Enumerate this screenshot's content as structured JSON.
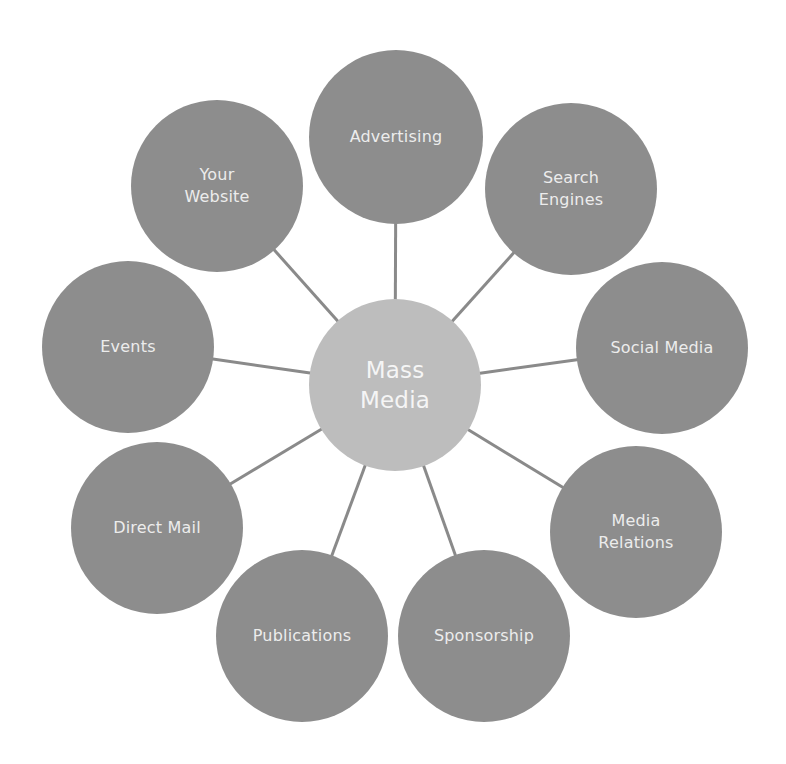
{
  "diagram": {
    "title": "Mass Media",
    "colors": {
      "background": "#ffffff",
      "node_fill": "#8d8d8d",
      "center_fill": "#bdbdbd",
      "connector": "#8a8a8a",
      "node_text": "#ececec",
      "center_text": "#f5f5f5"
    },
    "center": {
      "label": "Mass\nMedia",
      "cx": 395,
      "cy": 385,
      "r": 86
    },
    "nodes": [
      {
        "id": "advertising",
        "label": "Advertising",
        "cx": 396,
        "cy": 137,
        "r": 87
      },
      {
        "id": "search-engines",
        "label": "Search\nEngines",
        "cx": 571,
        "cy": 189,
        "r": 86
      },
      {
        "id": "social-media",
        "label": "Social Media",
        "cx": 662,
        "cy": 348,
        "r": 86
      },
      {
        "id": "media-relations",
        "label": "Media\nRelations",
        "cx": 636,
        "cy": 532,
        "r": 86
      },
      {
        "id": "sponsorship",
        "label": "Sponsorship",
        "cx": 484,
        "cy": 636,
        "r": 86
      },
      {
        "id": "publications",
        "label": "Publications",
        "cx": 302,
        "cy": 636,
        "r": 86
      },
      {
        "id": "direct-mail",
        "label": "Direct Mail",
        "cx": 157,
        "cy": 528,
        "r": 86
      },
      {
        "id": "events",
        "label": "Events",
        "cx": 128,
        "cy": 347,
        "r": 86
      },
      {
        "id": "your-website",
        "label": "Your\nWebsite",
        "cx": 217,
        "cy": 186,
        "r": 86
      }
    ]
  }
}
